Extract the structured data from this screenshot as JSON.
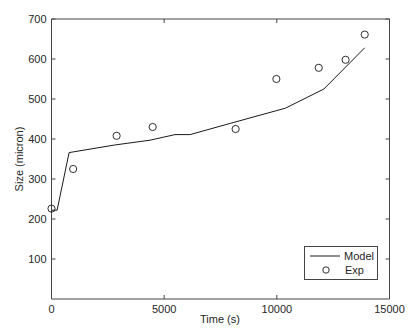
{
  "chart_data": {
    "type": "line",
    "title": "",
    "xlabel": "Time (s)",
    "ylabel": "Size (micron)",
    "xlim": [
      0,
      15000
    ],
    "ylim": [
      0,
      700
    ],
    "xticks": [
      0,
      5000,
      10000,
      15000
    ],
    "yticks": [
      100,
      200,
      300,
      400,
      500,
      600,
      700
    ],
    "xtick_labels": [
      "0",
      "5000",
      "10000",
      "15000"
    ],
    "ytick_labels": [
      "100",
      "200",
      "300",
      "400",
      "500",
      "600",
      "700"
    ],
    "grid": false,
    "legend_position": "lower right",
    "series": [
      {
        "name": "Model",
        "style": "line",
        "color": "#1a1a1a",
        "x": [
          0,
          250,
          780,
          2800,
          4370,
          5480,
          6150,
          7930,
          10380,
          12090,
          13900
        ],
        "y": [
          222,
          222,
          366,
          385,
          397,
          411,
          411,
          439,
          477,
          525,
          628
        ]
      },
      {
        "name": "Exp",
        "style": "marker-circle",
        "color": "#1a1a1a",
        "x": [
          0,
          960,
          2890,
          4490,
          8170,
          9980,
          11860,
          13050,
          13900
        ],
        "y": [
          226,
          325,
          408,
          430,
          425,
          550,
          578,
          598,
          661
        ]
      }
    ]
  },
  "legend": {
    "model_label": "Model",
    "exp_label": "Exp"
  },
  "axes": {
    "xlabel": "Time (s)",
    "ylabel": "Size (micron)"
  }
}
